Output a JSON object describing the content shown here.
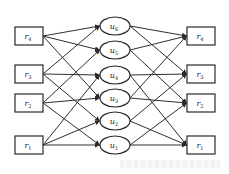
{
  "diagram": {
    "type": "bipartite-mapping",
    "colors": {
      "stroke": "#2a2a2a",
      "background": "#ffffff",
      "text": "#222222"
    },
    "left_nodes": [
      {
        "id": "L4",
        "base": "r",
        "sub": "4",
        "x": 15,
        "y": 27,
        "w": 28,
        "h": 18
      },
      {
        "id": "L3",
        "base": "r",
        "sub": "3",
        "x": 15,
        "y": 65,
        "w": 28,
        "h": 18
      },
      {
        "id": "L2",
        "base": "r",
        "sub": "2",
        "x": 15,
        "y": 94,
        "w": 28,
        "h": 18
      },
      {
        "id": "L1",
        "base": "r",
        "sub": "1",
        "x": 15,
        "y": 136,
        "w": 28,
        "h": 18
      }
    ],
    "middle_nodes": [
      {
        "id": "u6",
        "base": "u",
        "sub": "6",
        "cx": 115,
        "cy": 26,
        "rx": 15,
        "ry": 9
      },
      {
        "id": "u5",
        "base": "u",
        "sub": "5",
        "cx": 115,
        "cy": 50,
        "rx": 15,
        "ry": 9
      },
      {
        "id": "u4",
        "base": "u",
        "sub": "4",
        "cx": 115,
        "cy": 75,
        "rx": 15,
        "ry": 9
      },
      {
        "id": "u3",
        "base": "u",
        "sub": "3",
        "cx": 115,
        "cy": 98,
        "rx": 15,
        "ry": 9
      },
      {
        "id": "u2",
        "base": "u",
        "sub": "2",
        "cx": 115,
        "cy": 121,
        "rx": 15,
        "ry": 9
      },
      {
        "id": "u1",
        "base": "u",
        "sub": "1",
        "cx": 115,
        "cy": 145,
        "rx": 15,
        "ry": 9
      }
    ],
    "right_nodes": [
      {
        "id": "R4",
        "base": "r",
        "sub": "4",
        "x": 187,
        "y": 27,
        "w": 28,
        "h": 18
      },
      {
        "id": "R3",
        "base": "r",
        "sub": "3",
        "x": 187,
        "y": 65,
        "w": 28,
        "h": 18
      },
      {
        "id": "R2",
        "base": "r",
        "sub": "2",
        "x": 187,
        "y": 94,
        "w": 28,
        "h": 18
      },
      {
        "id": "R1",
        "base": "r",
        "sub": "1",
        "x": 187,
        "y": 136,
        "w": 28,
        "h": 18
      }
    ],
    "edges_left": [
      [
        "L4",
        "u6"
      ],
      [
        "L4",
        "u5"
      ],
      [
        "L4",
        "u3"
      ],
      [
        "L3",
        "u6"
      ],
      [
        "L3",
        "u4"
      ],
      [
        "L3",
        "u2"
      ],
      [
        "L2",
        "u5"
      ],
      [
        "L2",
        "u3"
      ],
      [
        "L2",
        "u1"
      ],
      [
        "L1",
        "u4"
      ],
      [
        "L1",
        "u2"
      ],
      [
        "L1",
        "u1"
      ]
    ],
    "edges_right": [
      [
        "u6",
        "R4"
      ],
      [
        "u6",
        "R3"
      ],
      [
        "u5",
        "R4"
      ],
      [
        "u5",
        "R2"
      ],
      [
        "u4",
        "R3"
      ],
      [
        "u4",
        "R1"
      ],
      [
        "u3",
        "R4"
      ],
      [
        "u3",
        "R2"
      ],
      [
        "u2",
        "R3"
      ],
      [
        "u2",
        "R1"
      ],
      [
        "u1",
        "R2"
      ],
      [
        "u1",
        "R1"
      ]
    ]
  }
}
